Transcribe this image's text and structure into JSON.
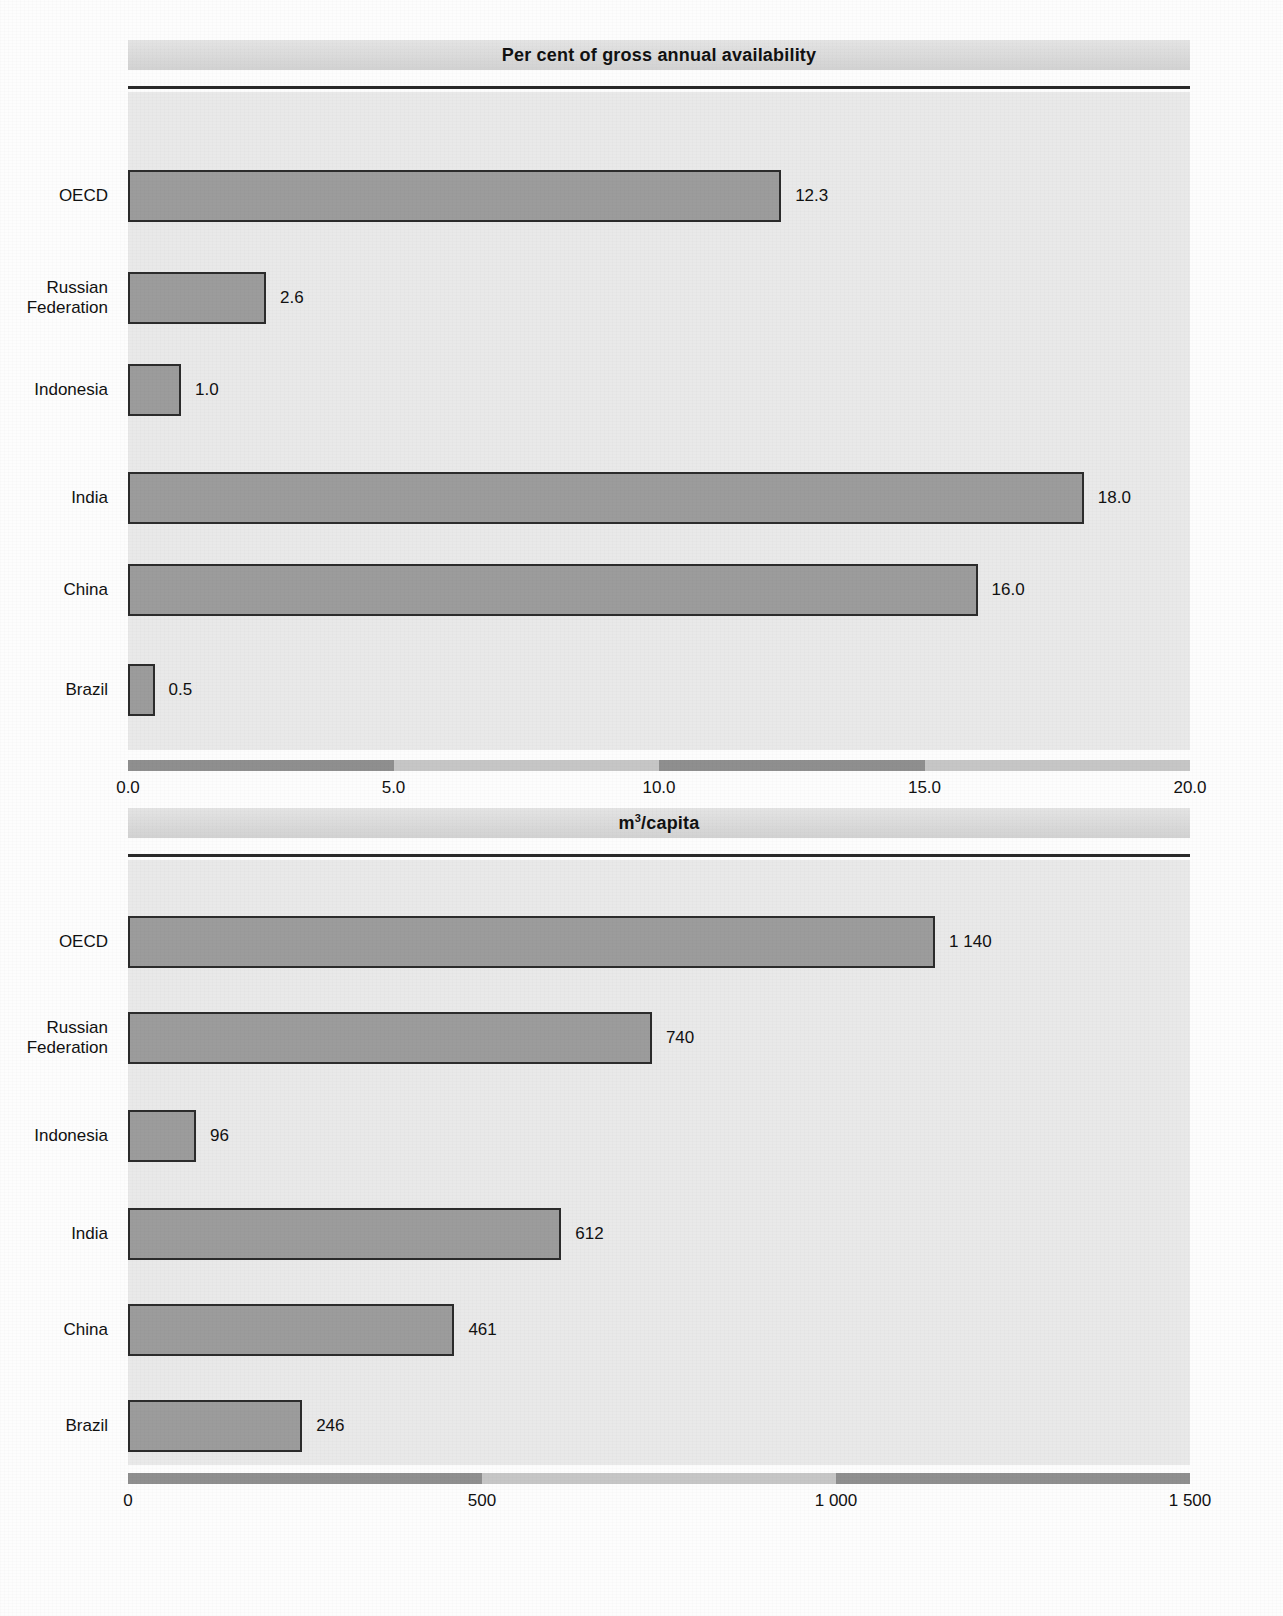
{
  "page": {
    "background_color": "#fdfdfd",
    "bar_fill_color": "#9c9c9c",
    "bar_border_color": "#2c2c2c",
    "plot_background_color": "#e9e9e9",
    "banner_color": "#dcdcdc"
  },
  "chart_data": [
    {
      "type": "bar",
      "orientation": "horizontal",
      "title": "Per cent of gross annual availability",
      "title_superscript": "",
      "xlabel": "",
      "ylabel": "",
      "categories": [
        "OECD",
        "Russian\nFederation",
        "Indonesia",
        "India",
        "China",
        "Brazil"
      ],
      "values": [
        12.3,
        2.6,
        1.0,
        18.0,
        16.0,
        0.5
      ],
      "value_labels": [
        "12.3",
        "2.6",
        "1.0",
        "18.0",
        "16.0",
        "0.5"
      ],
      "xlim": [
        0,
        20
      ],
      "xticks": [
        0,
        5,
        10,
        15,
        20
      ],
      "xtick_labels": [
        "0.0",
        "5.0",
        "10.0",
        "15.0",
        "20.0"
      ],
      "grid": false,
      "legend": "none"
    },
    {
      "type": "bar",
      "orientation": "horizontal",
      "title": "m/capita",
      "title_superscript": "3",
      "xlabel": "",
      "ylabel": "",
      "categories": [
        "OECD",
        "Russian\nFederation",
        "Indonesia",
        "India",
        "China",
        "Brazil"
      ],
      "values": [
        1140,
        740,
        96,
        612,
        461,
        246
      ],
      "value_labels": [
        "1 140",
        "740",
        "96",
        "612",
        "461",
        "246"
      ],
      "xlim": [
        0,
        1500
      ],
      "xticks": [
        0,
        500,
        1000,
        1500
      ],
      "xtick_labels": [
        "0",
        "500",
        "1 000",
        "1 500"
      ],
      "grid": false,
      "legend": "none"
    }
  ]
}
